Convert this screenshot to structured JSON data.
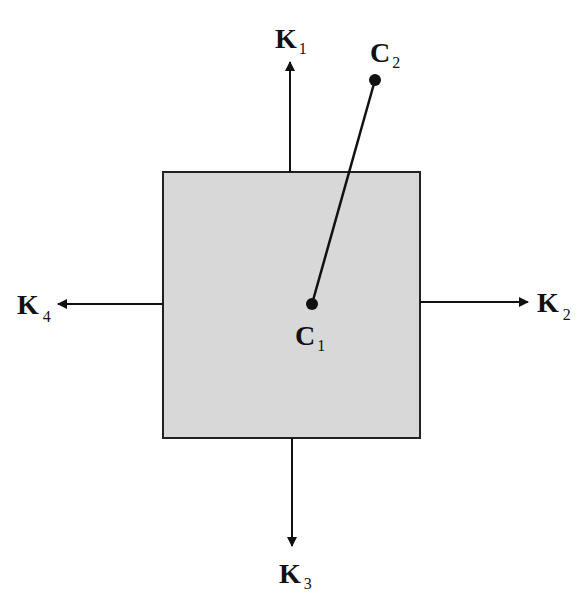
{
  "diagram": {
    "box": {
      "x": 163,
      "y": 172,
      "width": 257,
      "height": 266,
      "fill": "#d8d8d8",
      "stroke": "#222222"
    },
    "arrows": [
      {
        "name": "K1",
        "letter": "K",
        "sub": "1",
        "direction": "up"
      },
      {
        "name": "K2",
        "letter": "K",
        "sub": "2",
        "direction": "right"
      },
      {
        "name": "K3",
        "letter": "K",
        "sub": "3",
        "direction": "down"
      },
      {
        "name": "K4",
        "letter": "K",
        "sub": "4",
        "direction": "left"
      }
    ],
    "points": [
      {
        "name": "C1",
        "letter": "C",
        "sub": "1",
        "x": 312,
        "y": 304
      },
      {
        "name": "C2",
        "letter": "C",
        "sub": "2",
        "x": 375,
        "y": 80
      }
    ]
  }
}
